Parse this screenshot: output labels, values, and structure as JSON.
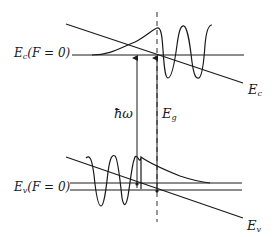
{
  "diagram": {
    "type": "band-diagram",
    "colors": {
      "line": "#1a1a1a",
      "background": "#ffffff"
    },
    "labels": {
      "ec_zero_field": {
        "main": "E",
        "sub": "c",
        "rest": "(F = 0)"
      },
      "ev_zero_field": {
        "main": "E",
        "sub": "v",
        "rest": "(F = 0)"
      },
      "ec_tilted": {
        "main": "E",
        "sub": "c"
      },
      "ev_tilted": {
        "main": "E",
        "sub": "v"
      },
      "photon_energy": "ħω",
      "gap": {
        "main": "E",
        "sub": "g"
      }
    },
    "elements": [
      "conduction band edge (tilted)",
      "valence band edge (tilted)",
      "conduction band edge at zero field (horizontal)",
      "valence band edge at zero field (horizontal)",
      "dashed vertical reference line",
      "conduction electron wavefunction (oscillating right, decaying left)",
      "valence hole wavefunction (oscillating left, decaying right)",
      "photon energy arrow ħω",
      "band gap arrow Eg"
    ]
  }
}
